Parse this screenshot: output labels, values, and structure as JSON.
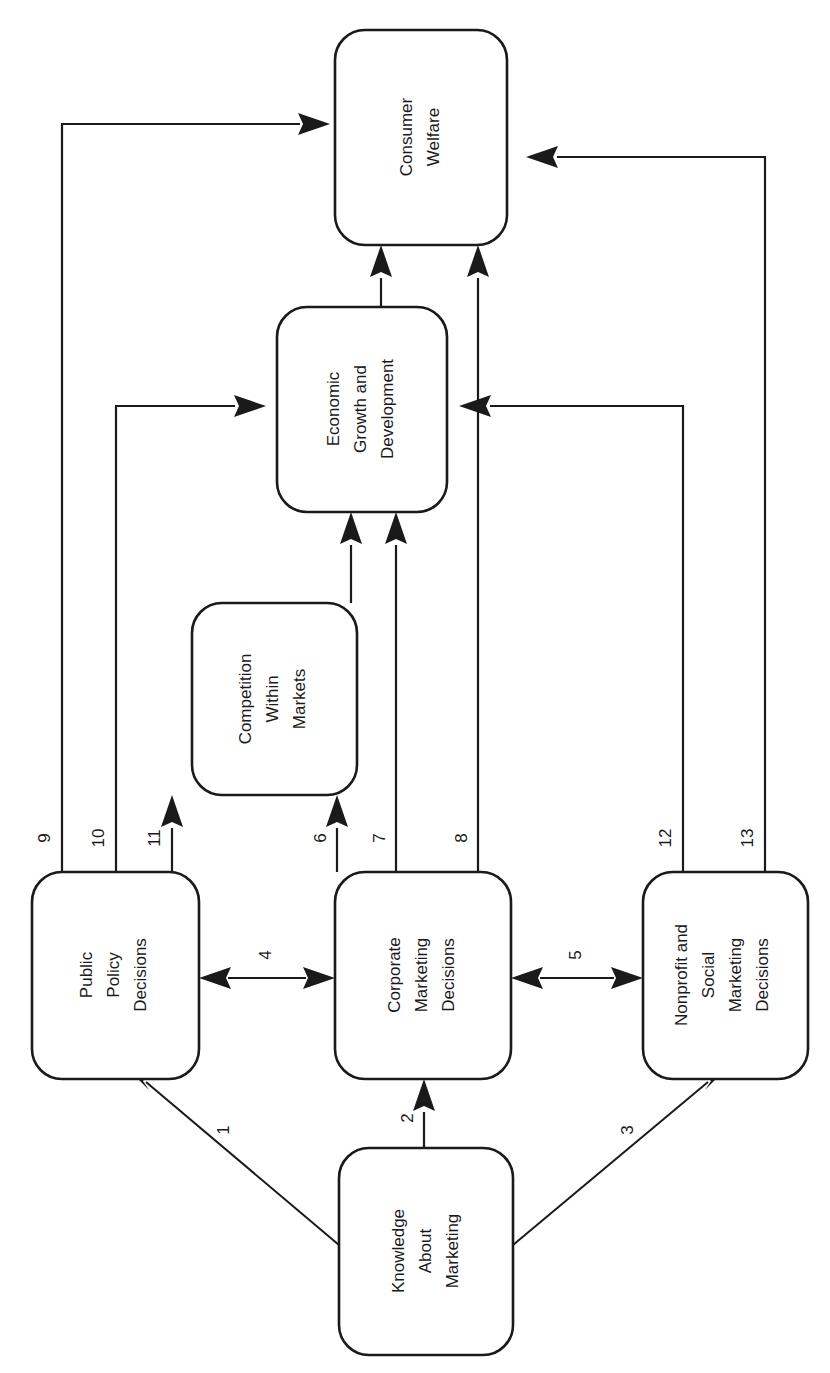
{
  "diagram": {
    "orientation": "rotated-90-ccw",
    "stroke_color": "#1a1a1a",
    "background_color": "#ffffff",
    "nodes": [
      {
        "id": "consumer-welfare",
        "lines": [
          "Consumer",
          "Welfare"
        ]
      },
      {
        "id": "economic-growth",
        "lines": [
          "Economic",
          "Growth and",
          "Development"
        ]
      },
      {
        "id": "competition-within-markets",
        "lines": [
          "Competition",
          "Within",
          "Markets"
        ]
      },
      {
        "id": "public-policy-decisions",
        "lines": [
          "Public",
          "Policy",
          "Decisions"
        ]
      },
      {
        "id": "corporate-marketing-decisions",
        "lines": [
          "Corporate",
          "Marketing",
          "Decisions"
        ]
      },
      {
        "id": "nonprofit-social-marketing-decisions",
        "lines": [
          "Nonprofit and",
          "Social",
          "Marketing",
          "Decisions"
        ]
      },
      {
        "id": "knowledge-about-marketing",
        "lines": [
          "Knowledge",
          "About",
          "Marketing"
        ]
      }
    ],
    "edges": [
      {
        "label": "1",
        "from": "knowledge-about-marketing",
        "to": "public-policy-decisions",
        "style": "single"
      },
      {
        "label": "2",
        "from": "knowledge-about-marketing",
        "to": "corporate-marketing-decisions",
        "style": "single"
      },
      {
        "label": "3",
        "from": "knowledge-about-marketing",
        "to": "nonprofit-social-marketing-decisions",
        "style": "single"
      },
      {
        "label": "4",
        "from": "public-policy-decisions",
        "to": "corporate-marketing-decisions",
        "style": "double"
      },
      {
        "label": "5",
        "from": "corporate-marketing-decisions",
        "to": "nonprofit-social-marketing-decisions",
        "style": "double"
      },
      {
        "label": "6",
        "from": "corporate-marketing-decisions",
        "to": "competition-within-markets",
        "style": "single"
      },
      {
        "label": "7",
        "from": "corporate-marketing-decisions",
        "to": "economic-growth",
        "style": "single"
      },
      {
        "label": "8",
        "from": "corporate-marketing-decisions",
        "to": "consumer-welfare",
        "style": "single"
      },
      {
        "label": "9",
        "from": "public-policy-decisions",
        "to": "consumer-welfare",
        "style": "single"
      },
      {
        "label": "10",
        "from": "public-policy-decisions",
        "to": "economic-growth",
        "style": "single"
      },
      {
        "label": "11",
        "from": "public-policy-decisions",
        "to": "competition-within-markets",
        "style": "single"
      },
      {
        "label": "12",
        "from": "nonprofit-social-marketing-decisions",
        "to": "economic-growth",
        "style": "single"
      },
      {
        "label": "13",
        "from": "nonprofit-social-marketing-decisions",
        "to": "consumer-welfare",
        "style": "single"
      }
    ],
    "implicit_edges": [
      {
        "from": "competition-within-markets",
        "to": "economic-growth"
      },
      {
        "from": "economic-growth",
        "to": "consumer-welfare"
      }
    ]
  }
}
